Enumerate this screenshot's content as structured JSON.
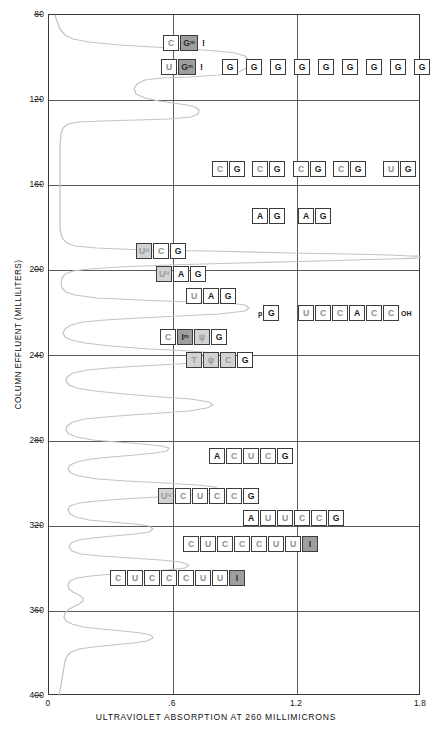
{
  "chart_data": {
    "type": "line",
    "title": "",
    "xlabel": "ULTRAVIOLET ABSORPTION AT 260 MILLIMICRONS",
    "ylabel": "COLUMN EFFLUENT (MILLILITERS)",
    "orientation": "horizontal-trace-vertical-axis",
    "xlim": [
      0,
      1.8
    ],
    "ylim": [
      400,
      80
    ],
    "xticks": [
      "0",
      ".6",
      "1.2",
      "1.8"
    ],
    "xtick_values": [
      0,
      0.6,
      1.2,
      1.8
    ],
    "yticks": [
      "80",
      "120",
      "160",
      "200",
      "240",
      "280",
      "320",
      "360",
      "400"
    ],
    "ytick_values": [
      80,
      120,
      160,
      200,
      240,
      280,
      320,
      360,
      400
    ],
    "grid": true,
    "grid_lines_x": [
      0.6,
      1.2
    ],
    "grid_lines_y": [
      120,
      160,
      200,
      240,
      280,
      320,
      360
    ],
    "legend": "none",
    "series_name": "ultraviolet absorption trace",
    "series_color": "#c0c0c0",
    "peaks": [
      {
        "effluent": 93,
        "absorption": 1.05
      },
      {
        "effluent": 101,
        "absorption": 0.96
      },
      {
        "effluent": 108,
        "absorption": 0.48
      },
      {
        "effluent": 163,
        "absorption": 0.52
      },
      {
        "effluent": 172,
        "absorption": 0.6
      },
      {
        "effluent": 181,
        "absorption": 0.55
      },
      {
        "effluent": 196,
        "absorption": 0.62
      },
      {
        "effluent": 205,
        "absorption": 0.52
      },
      {
        "effluent": 212,
        "absorption": 0.46
      },
      {
        "effluent": 219,
        "absorption": 0.52
      },
      {
        "effluent": 226,
        "absorption": 0.38
      },
      {
        "effluent": 234,
        "absorption": 0.52
      },
      {
        "effluent": 241,
        "absorption": 0.46
      },
      {
        "effluent": 285,
        "absorption": 0.66
      },
      {
        "effluent": 296,
        "absorption": 0.32
      },
      {
        "effluent": 305,
        "absorption": 0.46
      },
      {
        "effluent": 313,
        "absorption": 0.26
      },
      {
        "effluent": 326,
        "absorption": 0.55
      },
      {
        "effluent": 338,
        "absorption": 0.18
      },
      {
        "effluent": 347,
        "absorption": 0.3
      }
    ]
  },
  "axes": {
    "y_title": "COLUMN EFFLUENT (MILLILITERS)",
    "x_title": "ULTRAVIOLET ABSORPTION AT 260 MILLIMICRONS",
    "y_ticks": [
      {
        "label": "80"
      },
      {
        "label": "120"
      },
      {
        "label": "160"
      },
      {
        "label": "200"
      },
      {
        "label": "240"
      },
      {
        "label": "280"
      },
      {
        "label": "320"
      },
      {
        "label": "360"
      },
      {
        "label": "400"
      }
    ],
    "x_ticks": [
      {
        "label": "0"
      },
      {
        "label": ".6"
      },
      {
        "label": "1.2"
      },
      {
        "label": "1.8"
      }
    ]
  },
  "annotations": [
    {
      "id": "seq-c-gm",
      "top": 35,
      "left": 163,
      "bases": [
        {
          "base": "C",
          "shade": "mid",
          "sup": ""
        },
        {
          "base": "G",
          "shade": "fill-d",
          "sup": "m",
          "wide": true
        }
      ],
      "suffix": "!",
      "prefix": ""
    },
    {
      "id": "seq-u-gm",
      "top": 59,
      "left": 161,
      "bases": [
        {
          "base": "U",
          "shade": "mid",
          "sup": ""
        },
        {
          "base": "G",
          "shade": "fill-d",
          "sup": "m",
          "wide": true
        }
      ],
      "suffix": "!",
      "prefix": ""
    },
    {
      "id": "seq-g-run",
      "top": 59,
      "left": 222,
      "bases": [
        {
          "base": "G",
          "shade": "dark",
          "gapAfter": true
        },
        {
          "base": "G",
          "shade": "dark",
          "gapAfter": true
        },
        {
          "base": "G",
          "shade": "dark",
          "gapAfter": true
        },
        {
          "base": "G",
          "shade": "dark",
          "gapAfter": true
        },
        {
          "base": "G",
          "shade": "dark",
          "gapAfter": true
        },
        {
          "base": "G",
          "shade": "dark",
          "gapAfter": true
        },
        {
          "base": "G",
          "shade": "dark",
          "gapAfter": true
        },
        {
          "base": "G",
          "shade": "dark",
          "gapAfter": true
        },
        {
          "base": "G",
          "shade": "dark"
        }
      ],
      "suffix": "",
      "prefix": ""
    },
    {
      "id": "seq-cg-1",
      "top": 161,
      "left": 212,
      "bases": [
        {
          "base": "C",
          "shade": "mid"
        },
        {
          "base": "G",
          "shade": "dark"
        }
      ],
      "suffix": "",
      "prefix": ""
    },
    {
      "id": "seq-cg-2",
      "top": 161,
      "left": 252,
      "bases": [
        {
          "base": "C",
          "shade": "mid"
        },
        {
          "base": "G",
          "shade": "dark"
        }
      ],
      "suffix": "",
      "prefix": ""
    },
    {
      "id": "seq-cg-3",
      "top": 161,
      "left": 293,
      "bases": [
        {
          "base": "C",
          "shade": "mid"
        },
        {
          "base": "G",
          "shade": "dark"
        }
      ],
      "suffix": "",
      "prefix": ""
    },
    {
      "id": "seq-cg-4",
      "top": 161,
      "left": 333,
      "bases": [
        {
          "base": "C",
          "shade": "mid"
        },
        {
          "base": "G",
          "shade": "dark"
        }
      ],
      "suffix": "",
      "prefix": ""
    },
    {
      "id": "seq-ug",
      "top": 161,
      "left": 383,
      "bases": [
        {
          "base": "U",
          "shade": "mid"
        },
        {
          "base": "G",
          "shade": "dark"
        }
      ],
      "suffix": "",
      "prefix": ""
    },
    {
      "id": "seq-ag-1",
      "top": 208,
      "left": 252,
      "bases": [
        {
          "base": "A",
          "shade": "dark"
        },
        {
          "base": "G",
          "shade": "dark"
        }
      ],
      "suffix": "",
      "prefix": ""
    },
    {
      "id": "seq-ag-2",
      "top": 208,
      "left": 298,
      "bases": [
        {
          "base": "A",
          "shade": "dark"
        },
        {
          "base": "G",
          "shade": "dark"
        }
      ],
      "suffix": "",
      "prefix": ""
    },
    {
      "id": "seq-uh-c-g",
      "top": 243,
      "left": 136,
      "bases": [
        {
          "base": "U",
          "shade": "fill-l",
          "sup": "H"
        },
        {
          "base": "C",
          "shade": "mid"
        },
        {
          "base": "G",
          "shade": "dark"
        }
      ],
      "suffix": "",
      "prefix": ""
    },
    {
      "id": "seq-uh-a-g",
      "top": 266,
      "left": 156,
      "bases": [
        {
          "base": "U",
          "shade": "fill-l",
          "sup": "H"
        },
        {
          "base": "A",
          "shade": "dark"
        },
        {
          "base": "G",
          "shade": "dark"
        }
      ],
      "suffix": "",
      "prefix": ""
    },
    {
      "id": "seq-u-a-g",
      "top": 288,
      "left": 186,
      "bases": [
        {
          "base": "U",
          "shade": "mid"
        },
        {
          "base": "A",
          "shade": "dark"
        },
        {
          "base": "G",
          "shade": "dark"
        }
      ],
      "suffix": "",
      "prefix": ""
    },
    {
      "id": "seq-pg",
      "top": 305,
      "left": 257,
      "bases": [
        {
          "base": "G",
          "shade": "dark"
        }
      ],
      "suffix": "",
      "prefix": "p"
    },
    {
      "id": "seq-uccacc-oh",
      "top": 305,
      "left": 298,
      "bases": [
        {
          "base": "U",
          "shade": "mid"
        },
        {
          "base": "C",
          "shade": "mid"
        },
        {
          "base": "C",
          "shade": "mid"
        },
        {
          "base": "A",
          "shade": "dark"
        },
        {
          "base": "C",
          "shade": "mid"
        },
        {
          "base": "C",
          "shade": "mid"
        }
      ],
      "suffix": "OH",
      "prefix": ""
    },
    {
      "id": "seq-c-im-psi-g",
      "top": 329,
      "left": 160,
      "bases": [
        {
          "base": "C",
          "shade": "mid"
        },
        {
          "base": "I",
          "shade": "fill-d",
          "sup": "m"
        },
        {
          "base": "ψ",
          "shade": "fill-l"
        },
        {
          "base": "G",
          "shade": "dark"
        }
      ],
      "suffix": "",
      "prefix": ""
    },
    {
      "id": "seq-t-psi-c-g",
      "top": 352,
      "left": 186,
      "bases": [
        {
          "base": "T",
          "shade": "fill-l"
        },
        {
          "base": "ψ",
          "shade": "fill-l"
        },
        {
          "base": "C",
          "shade": "fill-l"
        },
        {
          "base": "G",
          "shade": "dark"
        }
      ],
      "suffix": "",
      "prefix": ""
    },
    {
      "id": "seq-a-c-u-c-g",
      "top": 448,
      "left": 209,
      "bases": [
        {
          "base": "A",
          "shade": "dark"
        },
        {
          "base": "C",
          "shade": "mid"
        },
        {
          "base": "U",
          "shade": "mid"
        },
        {
          "base": "C",
          "shade": "mid"
        },
        {
          "base": "G",
          "shade": "dark"
        }
      ],
      "suffix": "",
      "prefix": ""
    },
    {
      "id": "seq-uh-c-u-c-c-g",
      "top": 488,
      "left": 158,
      "bases": [
        {
          "base": "U",
          "shade": "fill-l",
          "sup": "H"
        },
        {
          "base": "C",
          "shade": "mid"
        },
        {
          "base": "U",
          "shade": "mid"
        },
        {
          "base": "C",
          "shade": "mid"
        },
        {
          "base": "C",
          "shade": "mid"
        },
        {
          "base": "G",
          "shade": "dark"
        }
      ],
      "suffix": "",
      "prefix": ""
    },
    {
      "id": "seq-a-u-u-c-c-g",
      "top": 510,
      "left": 243,
      "bases": [
        {
          "base": "A",
          "shade": "dark"
        },
        {
          "base": "U",
          "shade": "mid"
        },
        {
          "base": "U",
          "shade": "mid"
        },
        {
          "base": "C",
          "shade": "mid"
        },
        {
          "base": "C",
          "shade": "mid"
        },
        {
          "base": "G",
          "shade": "dark"
        }
      ],
      "suffix": "",
      "prefix": ""
    },
    {
      "id": "seq-cucccuu-i-1",
      "top": 536,
      "left": 183,
      "bases": [
        {
          "base": "C",
          "shade": "mid"
        },
        {
          "base": "U",
          "shade": "mid"
        },
        {
          "base": "C",
          "shade": "mid"
        },
        {
          "base": "C",
          "shade": "mid"
        },
        {
          "base": "C",
          "shade": "mid"
        },
        {
          "base": "U",
          "shade": "mid"
        },
        {
          "base": "U",
          "shade": "mid"
        },
        {
          "base": "I",
          "shade": "fill-d"
        }
      ],
      "suffix": "",
      "prefix": ""
    },
    {
      "id": "seq-cucccuu-i-2",
      "top": 570,
      "left": 110,
      "bases": [
        {
          "base": "C",
          "shade": "mid"
        },
        {
          "base": "U",
          "shade": "mid"
        },
        {
          "base": "C",
          "shade": "mid"
        },
        {
          "base": "C",
          "shade": "mid"
        },
        {
          "base": "C",
          "shade": "mid"
        },
        {
          "base": "U",
          "shade": "mid"
        },
        {
          "base": "U",
          "shade": "mid"
        },
        {
          "base": "I",
          "shade": "fill-d"
        }
      ],
      "suffix": "",
      "prefix": ""
    }
  ]
}
